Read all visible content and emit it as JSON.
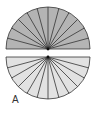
{
  "figure": {
    "label": "A",
    "top_semicircle": {
      "sectors": 12,
      "fill": "#b4b4b4",
      "stroke": "#333333",
      "orientation": "up"
    },
    "bottom_semicircle": {
      "sectors": 12,
      "fill": "#e2e2e2",
      "stroke": "#333333",
      "orientation": "down"
    }
  }
}
